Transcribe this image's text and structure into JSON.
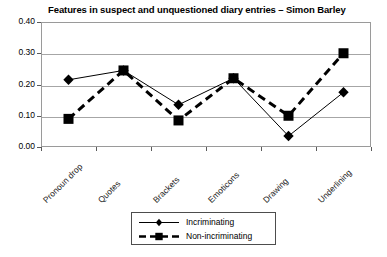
{
  "chart_data": {
    "type": "line",
    "title": "Features in suspect and unquestioned diary entries – Simon Barley",
    "xlabel": "",
    "ylabel": "",
    "categories": [
      "Pronoun drop",
      "Quotes",
      "Brackets",
      "Emoticons",
      "Drawing",
      "Underlining"
    ],
    "series": [
      {
        "name": "Incriminating",
        "marker": "diamond",
        "line_style": "solid",
        "line_width": 1,
        "color": "#000000",
        "values": [
          0.215,
          0.245,
          0.135,
          0.22,
          0.035,
          0.175
        ]
      },
      {
        "name": "Non-incriminating",
        "marker": "square",
        "line_style": "dashed",
        "line_width": 3,
        "color": "#000000",
        "values": [
          0.09,
          0.245,
          0.085,
          0.22,
          0.1,
          0.3
        ]
      }
    ],
    "ylim": [
      0.0,
      0.4
    ],
    "yticks": [
      "0.00",
      "0.10",
      "0.20",
      "0.30",
      "0.40"
    ],
    "ytick_values": [
      0.0,
      0.1,
      0.2,
      0.3,
      0.4
    ],
    "grid": true,
    "grid_axis": "y",
    "legend_position": "bottom",
    "legend_entries": [
      "Incriminating",
      "Non-incriminating"
    ]
  }
}
